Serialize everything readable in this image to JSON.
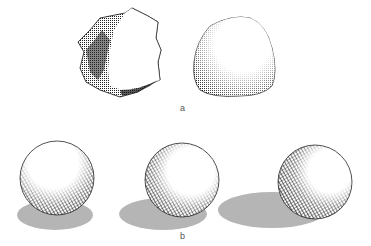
{
  "figure": {
    "panel_a": {
      "label": "a",
      "objects": [
        {
          "name": "angular-rock",
          "description": "faceted stone with dark shaded left side"
        },
        {
          "name": "rounded-rock",
          "description": "rounded stone with stippled shading at bottom-left"
        }
      ]
    },
    "panel_b": {
      "label": "b",
      "objects": [
        {
          "name": "sphere-light-above",
          "shadow": "below"
        },
        {
          "name": "sphere-light-right",
          "shadow": "left"
        },
        {
          "name": "sphere-light-low-right",
          "shadow": "long-left"
        }
      ]
    },
    "colors": {
      "ink": "#111111",
      "shadow": "#b5b5b5",
      "background": "#ffffff"
    }
  }
}
